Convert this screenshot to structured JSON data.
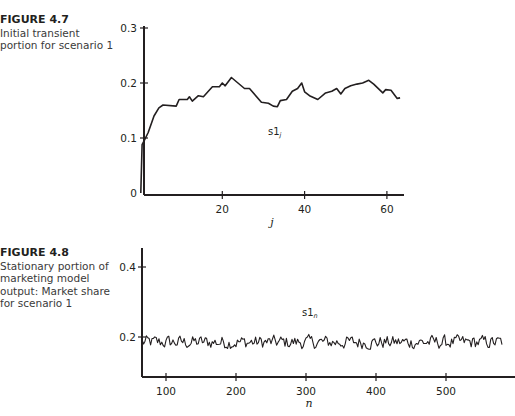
{
  "figures": [
    {
      "number": "FIGURE 4.7",
      "caption": "Initial transient portion for scenario 1"
    },
    {
      "number": "FIGURE 4.8",
      "caption": "Stationary portion of marketing model output: Market share for scenario 1"
    }
  ],
  "chart_data": [
    {
      "type": "line",
      "title": "FIGURE 4.7 Initial transient portion for scenario 1",
      "xlabel": "j",
      "ylabel": "",
      "series_label": "s1",
      "series_label_sub": "j",
      "xlim": [
        0,
        64
      ],
      "ylim": [
        0,
        0.3
      ],
      "xticks": [
        20,
        40,
        60
      ],
      "xtick_labels": [
        "20",
        "40",
        "60"
      ],
      "yticks": [
        0,
        0.1,
        0.2,
        0.3
      ],
      "ytick_labels": [
        "0",
        "0.1",
        "0.2",
        "0.3"
      ],
      "grid": false,
      "series": [
        {
          "name": "s1_j",
          "x": [
            0.2,
            0.5,
            1,
            2,
            3.4,
            4.6,
            5.6,
            8.8,
            9.5,
            11.5,
            12,
            12.7,
            14.2,
            15.4,
            17.6,
            19.3,
            20,
            20.7,
            22.2,
            25.4,
            26.6,
            29.5,
            31.2,
            32.4,
            33.4,
            34.1,
            35.6,
            37,
            38.3,
            39.3,
            40,
            41.2,
            43.2,
            45.1,
            46.6,
            47.8,
            48.8,
            49.8,
            51.2,
            52.7,
            54.1,
            55.6,
            56.8,
            59,
            59.7,
            61,
            62.5,
            63.2
          ],
          "values": [
            0.0,
            0.088,
            0.095,
            0.11,
            0.14,
            0.155,
            0.16,
            0.158,
            0.17,
            0.17,
            0.175,
            0.167,
            0.177,
            0.175,
            0.193,
            0.193,
            0.2,
            0.195,
            0.21,
            0.19,
            0.19,
            0.165,
            0.163,
            0.158,
            0.157,
            0.168,
            0.17,
            0.185,
            0.19,
            0.2,
            0.184,
            0.177,
            0.17,
            0.182,
            0.185,
            0.19,
            0.18,
            0.19,
            0.195,
            0.198,
            0.2,
            0.205,
            0.198,
            0.182,
            0.188,
            0.187,
            0.172,
            0.173
          ]
        }
      ]
    },
    {
      "type": "line",
      "title": "FIGURE 4.8 Stationary portion of marketing model output: Market share for scenario 1",
      "xlabel": "n",
      "ylabel": "",
      "series_label": "s1",
      "series_label_sub": "n",
      "xlim": [
        66,
        580
      ],
      "ylim": [
        0,
        0.45
      ],
      "xticks": [
        100,
        200,
        300,
        400,
        500
      ],
      "xtick_labels": [
        "100",
        "200",
        "300",
        "400",
        "500"
      ],
      "yticks": [
        0.2,
        0.4
      ],
      "ytick_labels": [
        "0.2",
        "0.4"
      ],
      "grid": false,
      "series": [
        {
          "name": "s1_n",
          "n_start": 66,
          "n_end": 580,
          "mean": 0.185,
          "min": 0.16,
          "max": 0.215,
          "description": "noisy stationary series fluctuating around ~0.185"
        }
      ]
    }
  ]
}
